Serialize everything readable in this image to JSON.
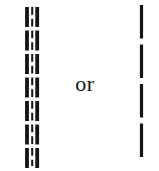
{
  "figure": {
    "background_color": "#ffffff",
    "ink_color": "#141414",
    "separator_label": "or",
    "canvas": {
      "width": 159,
      "height": 171
    },
    "left_symbol": {
      "name": "triple-dashed-line",
      "lines": [
        {
          "role": "outer-left-dashed-stroke",
          "x": 27,
          "y1": 7,
          "y2": 168,
          "stroke_width": 3.8,
          "dash": "20 3.5"
        },
        {
          "role": "inner-short-dashed-stroke",
          "x": 32.2,
          "y1": 7,
          "y2": 166,
          "stroke_width": 2,
          "dash": "7.75 4"
        },
        {
          "role": "outer-right-dashed-stroke",
          "x": 37.2,
          "y1": 7,
          "y2": 168,
          "stroke_width": 3.8,
          "dash": "20 3.5"
        }
      ]
    },
    "right_symbol": {
      "name": "single-dashed-line",
      "lines": [
        {
          "role": "long-dashed-stroke",
          "x": 141.5,
          "y1": 5,
          "y2": 158,
          "stroke_width": 3.2,
          "dash": "33.5 6"
        }
      ]
    }
  }
}
